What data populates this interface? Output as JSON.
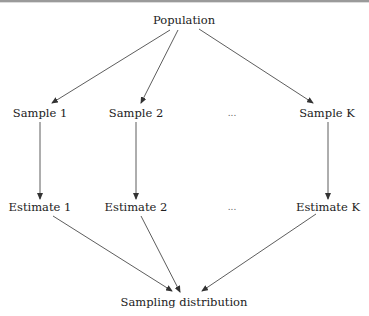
{
  "diagram": {
    "nodes": {
      "population": "Population",
      "sample_1": "Sample 1",
      "sample_2": "Sample 2",
      "sample_dots": "...",
      "sample_k": "Sample K",
      "estimate_1": "Estimate 1",
      "estimate_2": "Estimate 2",
      "estimate_dots": "...",
      "estimate_k": "Estimate K",
      "sampling_distribution": "Sampling distribution"
    },
    "edges": [
      {
        "from": "Population",
        "to": "Sample 1"
      },
      {
        "from": "Population",
        "to": "Sample 2"
      },
      {
        "from": "Population",
        "to": "Sample K"
      },
      {
        "from": "Sample 1",
        "to": "Estimate 1"
      },
      {
        "from": "Sample 2",
        "to": "Estimate 2"
      },
      {
        "from": "Sample K",
        "to": "Estimate K"
      },
      {
        "from": "Estimate 1",
        "to": "Sampling distribution"
      },
      {
        "from": "Estimate 2",
        "to": "Sampling distribution"
      },
      {
        "from": "Estimate K",
        "to": "Sampling distribution"
      }
    ],
    "colors": {
      "line": "#333333",
      "text": "#222222",
      "background": "#ffffff"
    }
  }
}
